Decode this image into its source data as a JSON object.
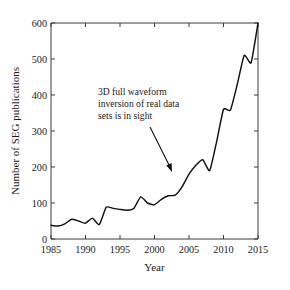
{
  "figure": {
    "background_color": "#ffffff",
    "line_color": "#111111",
    "axis_color": "#3a3a3a"
  },
  "annotation": {
    "line1": "3D full waveform",
    "line2": "inversion of real data",
    "line3": "sets is in sight",
    "points_to_year": 2004,
    "points_to_value": 145
  },
  "chart_data": {
    "type": "line",
    "title": "",
    "subtitle": "",
    "xlabel": "Year",
    "ylabel": "Number of SEG publications",
    "xlim": [
      1985,
      2015
    ],
    "ylim": [
      0,
      600
    ],
    "xticks": [
      1985,
      1990,
      1995,
      2000,
      2005,
      2010,
      2015
    ],
    "xticklabels": [
      "1985",
      "1990",
      "1995",
      "2000",
      "2005",
      "2010",
      "2015"
    ],
    "yticks": [
      0,
      100,
      200,
      300,
      400,
      500,
      600
    ],
    "yticklabels": [
      "0",
      "100",
      "200",
      "300",
      "400",
      "500",
      "600"
    ],
    "grid": false,
    "legend": null,
    "legend_position": "none",
    "x": [
      1985,
      1986,
      1987,
      1988,
      1989,
      1990,
      1991,
      1992,
      1993,
      1994,
      1995,
      1996,
      1997,
      1998,
      1999,
      2000,
      2001,
      2002,
      2003,
      2004,
      2005,
      2006,
      2007,
      2008,
      2009,
      2010,
      2011,
      2012,
      2013,
      2014,
      2015
    ],
    "series": [
      {
        "name": "Number of SEG publications",
        "values": [
          38,
          36,
          42,
          55,
          50,
          44,
          58,
          40,
          88,
          85,
          82,
          80,
          85,
          117,
          100,
          95,
          110,
          120,
          122,
          145,
          180,
          205,
          220,
          190,
          270,
          360,
          358,
          430,
          510,
          490,
          600
        ]
      }
    ],
    "annotations": [
      {
        "text": "3D full waveform inversion of real data sets is in sight",
        "target_x": 2004,
        "target_y": 145
      }
    ]
  }
}
